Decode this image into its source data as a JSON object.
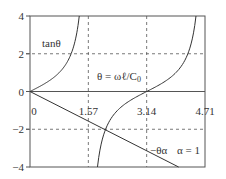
{
  "chart_data": {
    "type": "line",
    "title": "",
    "xlabel": "",
    "ylabel": "",
    "xlim": [
      0,
      4.71
    ],
    "ylim": [
      -4,
      4
    ],
    "grid": "dashed at x=1.57, x=3.14 and y=2, y=-2",
    "x_ticks": [
      {
        "value": 0,
        "label": "0"
      },
      {
        "value": 1.57,
        "label": "1.57"
      },
      {
        "value": 3.14,
        "label": "3.14"
      },
      {
        "value": 4.71,
        "label": "4.71"
      }
    ],
    "y_ticks": [
      {
        "value": 4,
        "label": "4"
      },
      {
        "value": 2,
        "label": "2"
      },
      {
        "value": 0,
        "label": "0"
      },
      {
        "value": -2,
        "label": "−2"
      },
      {
        "value": -4,
        "label": "−4"
      }
    ],
    "series": [
      {
        "name": "tan θ",
        "function": "tan(theta)",
        "branches": [
          [
            0,
            1.3258
          ],
          [
            1.8158,
            4.4674
          ]
        ],
        "points": [
          [
            0,
            0
          ],
          [
            0.3,
            0.309
          ],
          [
            0.6,
            0.684
          ],
          [
            0.8,
            1.03
          ],
          [
            1.0,
            1.557
          ],
          [
            1.1,
            1.965
          ],
          [
            1.2,
            2.572
          ],
          [
            1.3258,
            4
          ],
          [
            1.8158,
            -4
          ],
          [
            2.0,
            -2.185
          ],
          [
            2.3,
            -1.119
          ],
          [
            2.6,
            -0.602
          ],
          [
            2.9,
            -0.246
          ],
          [
            3.1416,
            0
          ],
          [
            3.4,
            0.264
          ],
          [
            3.7,
            0.625
          ],
          [
            4.0,
            1.158
          ],
          [
            4.2,
            1.777
          ],
          [
            4.3,
            2.282
          ],
          [
            4.4674,
            4
          ]
        ]
      },
      {
        "name": "−θα",
        "function": "-alpha*theta",
        "alpha": 1,
        "points": [
          [
            0,
            0
          ],
          [
            4,
            -4
          ]
        ]
      }
    ],
    "annotations": [
      {
        "text": "tanθ",
        "near": "tan curve first branch"
      },
      {
        "text": "θ = ωℓ/C₀",
        "near": "center"
      },
      {
        "text": "−θα",
        "near": "line, lower right"
      },
      {
        "text": "α = 1",
        "near": "lower right"
      }
    ],
    "intersection": {
      "theta": 2.0288,
      "value": -2.0288
    }
  },
  "labels": {
    "tan": "tanθ",
    "theta_eq": "θ = ωℓ/C",
    "theta_eq_sub": "0",
    "line": "−θα",
    "alpha": "α = 1"
  }
}
